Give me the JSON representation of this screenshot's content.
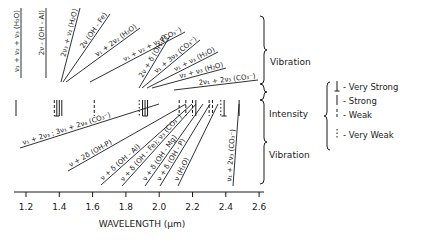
{
  "diagram": {
    "xaxis": {
      "title": "WAVELENGTH (μm)",
      "ticks": [
        "1.2",
        "1.4",
        "1.6",
        "1.8",
        "2.0",
        "2.2",
        "2.4",
        "2.6"
      ],
      "range": [
        1.2,
        2.6
      ]
    },
    "side_labels": {
      "vibration_top": "Vibration",
      "intensity": "Intensity",
      "vibration_bottom": "Vibration"
    },
    "legend": {
      "items": [
        {
          "symbol": "very-strong",
          "label": "- Very Strong"
        },
        {
          "symbol": "strong",
          "label": "- Strong"
        },
        {
          "symbol": "weak",
          "label": "- Weak"
        },
        {
          "symbol": "very-weak",
          "label": "- Very Weak"
        }
      ]
    },
    "upper_labels": [
      {
        "text": "ν₁ + ν₂ + ν₃ (H₂O)",
        "wavelength": 1.14
      },
      {
        "text": "2ν - (OH - Al)",
        "wavelength": 1.39
      },
      {
        "text": "2ν₃ + ν₂ (H₂O)",
        "wavelength": 1.38
      },
      {
        "text": "2ν (OH - Fe)",
        "wavelength": 1.41
      },
      {
        "text": "ν₁ + 2ν₂ (H₂O)",
        "wavelength": 1.45
      },
      {
        "text": "ν₁ + ν₂ + ν₃ (CO₃⁻)",
        "wavelength": 1.6
      },
      {
        "text": "2ν + δ (OH-P)",
        "wavelength": 1.88
      },
      {
        "text": "ν₁ + 3ν₃ (CO₃⁻)",
        "wavelength": 1.9
      },
      {
        "text": "ν₁ + ν₃ (H₂O)",
        "wavelength": 1.92
      },
      {
        "text": "ν₂ + ν₃ (H₂O)",
        "wavelength": 1.94
      },
      {
        "text": "2ν₁ + 2ν₃ (CO₃⁻)",
        "wavelength": 2.0
      }
    ],
    "lower_labels": [
      {
        "text": "ν₁ + 2ν₃ ; 3ν₁ + 2ν₄ (CO₃⁻)",
        "wavelength": 2.16
      },
      {
        "text": "ν + 2δ (OH-P)",
        "wavelength": 2.17
      },
      {
        "text": "ν + δ (OH - Al)",
        "wavelength": 2.2
      },
      {
        "text": "ν + δ (OH - Fe); ν₃ (CO₃⁻)",
        "wavelength": 2.24
      },
      {
        "text": "ν + δ (OH - Mg)",
        "wavelength": 2.3
      },
      {
        "text": "ν + δ (OH - P)",
        "wavelength": 2.32
      },
      {
        "text": "ν (H₂O)",
        "wavelength": 2.38
      },
      {
        "text": "ν₁ + 2ν₃ (CO₃⁻)",
        "wavelength": 2.5
      }
    ],
    "intensity_marks": [
      {
        "wavelength": 1.14,
        "type": "strong"
      },
      {
        "wavelength": 1.37,
        "type": "weak"
      },
      {
        "wavelength": 1.385,
        "type": "very-strong"
      },
      {
        "wavelength": 1.4,
        "type": "strong"
      },
      {
        "wavelength": 1.415,
        "type": "strong"
      },
      {
        "wavelength": 1.61,
        "type": "weak"
      },
      {
        "wavelength": 1.88,
        "type": "very-weak"
      },
      {
        "wavelength": 1.9,
        "type": "strong"
      },
      {
        "wavelength": 1.915,
        "type": "very-strong"
      },
      {
        "wavelength": 1.93,
        "type": "strong"
      },
      {
        "wavelength": 2.12,
        "type": "weak"
      },
      {
        "wavelength": 2.16,
        "type": "weak"
      },
      {
        "wavelength": 2.2,
        "type": "weak"
      },
      {
        "wavelength": 2.22,
        "type": "strong"
      },
      {
        "wavelength": 2.3,
        "type": "weak"
      },
      {
        "wavelength": 2.32,
        "type": "weak"
      },
      {
        "wavelength": 2.37,
        "type": "very-weak"
      },
      {
        "wavelength": 2.39,
        "type": "very-strong"
      },
      {
        "wavelength": 2.48,
        "type": "strong"
      }
    ]
  }
}
